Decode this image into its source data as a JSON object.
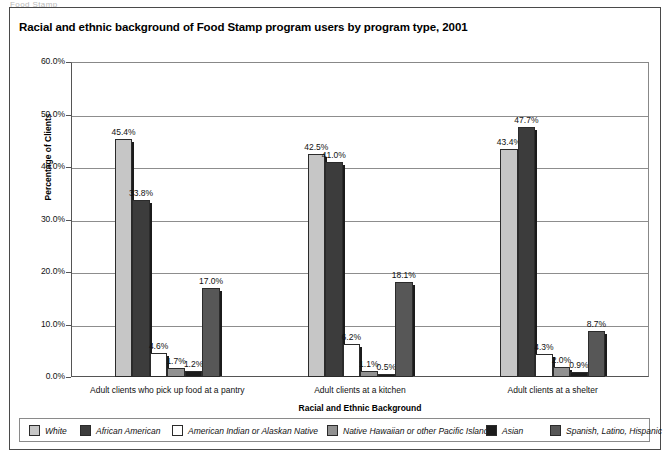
{
  "figure": {
    "cutoff_header": "Food Stamp",
    "title": "Racial and ethnic background of Food Stamp program users by program type, 2001"
  },
  "chart_data": {
    "type": "bar",
    "title": "Racial and ethnic background of Food Stamp program users by program type, 2001",
    "xlabel": "Racial and Ethnic Background",
    "ylabel": "Percentage of Clients",
    "ylim": [
      0,
      60
    ],
    "ytick_labels": [
      "0.0%",
      "10.0%",
      "20.0%",
      "30.0%",
      "40.0%",
      "50.0%",
      "60.0%"
    ],
    "ytick_values": [
      0,
      10,
      20,
      30,
      40,
      50,
      60
    ],
    "grid": true,
    "legend_position": "bottom",
    "categories": [
      "Adult clients who pick up food at a pantry",
      "Adult clients at a kitchen",
      "Adult clients at a shelter"
    ],
    "series": [
      {
        "name": "White",
        "color": "#c6c6c6",
        "values": [
          45.4,
          42.5,
          43.4
        ],
        "labels": [
          "45.4%",
          "42.5%",
          "43.4%"
        ]
      },
      {
        "name": "African American",
        "color": "#3c3c3c",
        "values": [
          33.8,
          41.0,
          47.7
        ],
        "labels": [
          "33.8%",
          "41.0%",
          "47.7%"
        ]
      },
      {
        "name": "American Indian or Alaskan Native",
        "color": "#ffffff",
        "values": [
          4.6,
          6.2,
          4.3
        ],
        "labels": [
          "4.6%",
          "6.2%",
          "4.3%"
        ]
      },
      {
        "name": "Native Hawaiian or other Pacific Islander",
        "color": "#919191",
        "values": [
          1.7,
          1.1,
          2.0
        ],
        "labels": [
          "1.7%",
          "1.1%",
          "2.0%"
        ]
      },
      {
        "name": "Asian",
        "color": "#1c1c1c",
        "values": [
          1.2,
          0.5,
          0.9
        ],
        "labels": [
          "1.2%",
          "0.5%",
          "0.9%"
        ]
      },
      {
        "name": "Spanish, Latino, Hispanic",
        "color": "#575757",
        "values": [
          17.0,
          18.1,
          8.7
        ],
        "labels": [
          "17.0%",
          "18.1%",
          "8.7%"
        ]
      }
    ]
  }
}
